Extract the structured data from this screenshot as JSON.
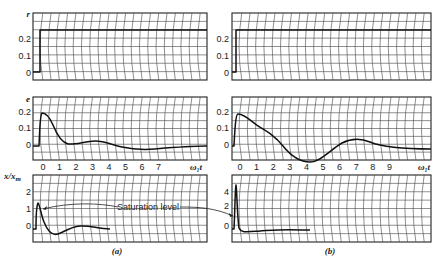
{
  "chart_data": [
    {
      "panel": "(a)",
      "type": "line",
      "subplots": [
        {
          "ylabel": "r",
          "yticks": [
            "0.2",
            "0.1",
            "0"
          ],
          "ylim": [
            -0.05,
            0.3
          ],
          "description": "step input to 0.25 at t=0",
          "x": [
            0,
            0,
            7.8
          ],
          "y": [
            0,
            0.25,
            0.25
          ]
        },
        {
          "ylabel": "e",
          "yticks": [
            "0.2",
            "0.1",
            "0"
          ],
          "ylim": [
            -0.1,
            0.3
          ],
          "x": [
            -0.5,
            0,
            0.3,
            0.8,
            1.2,
            1.7,
            2.2,
            3,
            3.6,
            4.5,
            5.5,
            6.5,
            7.3,
            7.8
          ],
          "y": [
            0,
            0.25,
            0.24,
            0.17,
            0.08,
            0.02,
            0.01,
            0.02,
            0.02,
            0.0,
            -0.01,
            -0.005,
            0.0,
            0.0
          ]
        },
        {
          "ylabel": "x/x_m",
          "yticks": [
            "2",
            "1",
            "0"
          ],
          "ylim": [
            -1,
            3
          ],
          "x": [
            -0.6,
            -0.5,
            -0.4,
            -0.2,
            0.2,
            1.0,
            1.6,
            2.5,
            3.2,
            3.8
          ],
          "y": [
            0,
            1.5,
            1.2,
            0.4,
            -0.2,
            -0.3,
            0.05,
            0.1,
            0.0,
            0.0
          ]
        }
      ],
      "xticks": [
        "0",
        "1",
        "2",
        "3",
        "4",
        "5",
        "6",
        "7"
      ],
      "xlabel": "ω₁t",
      "annotation": "Saturation level",
      "saturation_level": 1
    },
    {
      "panel": "(b)",
      "type": "line",
      "subplots": [
        {
          "ylabel": "",
          "yticks": [
            "0.2",
            "0.1",
            "0"
          ],
          "ylim": [
            -0.05,
            0.3
          ],
          "x": [
            0,
            0,
            11.8
          ],
          "y": [
            0,
            0.25,
            0.25
          ]
        },
        {
          "ylabel": "",
          "yticks": [
            "0.2",
            "0.1",
            "0"
          ],
          "ylim": [
            -0.1,
            0.3
          ],
          "x": [
            -0.5,
            0,
            0.5,
            1,
            2,
            3,
            4,
            5,
            6,
            7,
            8,
            9,
            10,
            11.5
          ],
          "y": [
            0,
            0.25,
            0.23,
            0.17,
            0.12,
            0.04,
            -0.04,
            -0.07,
            -0.02,
            0.02,
            0.04,
            0.02,
            -0.005,
            -0.01
          ]
        },
        {
          "ylabel": "",
          "yticks": [
            "4",
            "2",
            "0"
          ],
          "ylim": [
            -2,
            6
          ],
          "x": [
            -0.4,
            -0.3,
            -0.2,
            0,
            0.5,
            2,
            3.5,
            5
          ],
          "y": [
            0,
            5,
            0,
            -0.3,
            -0.2,
            0.1,
            0.15,
            0.0
          ]
        }
      ],
      "xticks": [
        "0",
        "1",
        "2",
        "3",
        "4",
        "5",
        "6",
        "7",
        "8",
        "9"
      ],
      "xlabel": "ω₁t"
    }
  ],
  "labels": {
    "r": "r",
    "e": "e",
    "x": "x/x",
    "m": "m",
    "xaxis": "ω₁t",
    "saturation": "Saturation level",
    "panel_a": "(a)",
    "panel_b": "(b)",
    "ticks_a": [
      "0",
      "1",
      "2",
      "3",
      "4",
      "5",
      "6",
      "7"
    ],
    "ticks_b": [
      "0",
      "1",
      "2",
      "3",
      "4",
      "5",
      "6",
      "7",
      "8",
      "9"
    ],
    "yt_r": [
      "0.2",
      "0.1",
      "0"
    ],
    "yt_xa": [
      "2",
      "1",
      "0"
    ],
    "yt_xb": [
      "4",
      "2",
      "0"
    ]
  }
}
